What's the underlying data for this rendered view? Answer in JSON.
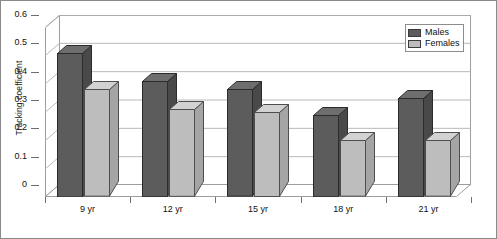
{
  "chart_data": {
    "type": "bar",
    "title": "",
    "xlabel": "",
    "ylabel": "Tracking coefficient",
    "categories": [
      "9 yr",
      "12 yr",
      "15 yr",
      "18 yr",
      "21 yr"
    ],
    "series": [
      {
        "name": "Males",
        "color": "#5c5c5c",
        "values": [
          0.51,
          0.41,
          0.38,
          0.29,
          0.35
        ]
      },
      {
        "name": "Females",
        "color": "#bdbdbd",
        "values": [
          0.38,
          0.31,
          0.3,
          0.2,
          0.2
        ]
      }
    ],
    "ylim": [
      0,
      0.6
    ],
    "ytick_step": 0.1,
    "ytick_labels": [
      "0.6",
      "0.5",
      "0.4",
      "0.3",
      "0.2",
      "0.1",
      "0"
    ],
    "ytick_values": [
      0.6,
      0.5,
      0.4,
      0.3,
      0.2,
      0.1,
      0
    ],
    "grid": true,
    "grid_axis": "y",
    "legend_position": "top-right",
    "style_3d": true
  },
  "legend": {
    "entries": [
      {
        "label": "Males"
      },
      {
        "label": "Females"
      }
    ]
  },
  "axis": {
    "y_title": "Tracking coefficient"
  }
}
